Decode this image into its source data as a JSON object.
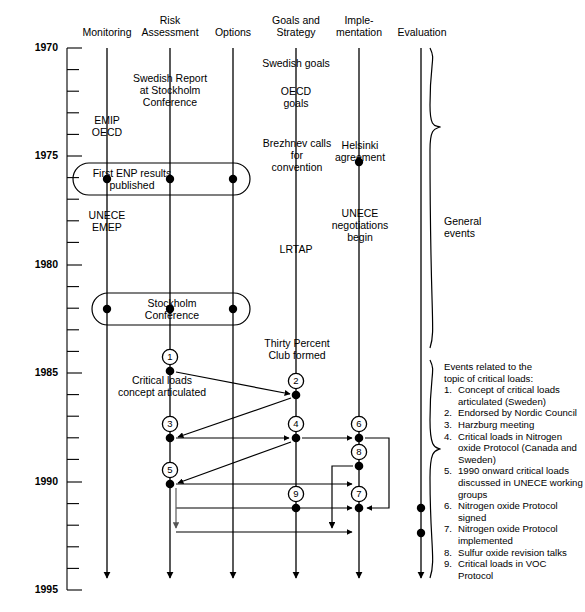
{
  "diagram": {
    "axis": {
      "label": "year",
      "start": 1970,
      "end": 1995,
      "major_ticks": [
        1970,
        1975,
        1980,
        1985,
        1990,
        1995
      ],
      "tick_interval": 1
    },
    "columns": [
      {
        "id": "monitoring",
        "label": "Monitoring"
      },
      {
        "id": "risk",
        "label": "Risk\nAssessment"
      },
      {
        "id": "options",
        "label": "Options"
      },
      {
        "id": "goals",
        "label": "Goals and\nStrategy"
      },
      {
        "id": "implementation",
        "label": "Imple-\nmentation"
      },
      {
        "id": "evaluation",
        "label": "Evaluation"
      }
    ],
    "events": [
      {
        "id": "emip-oecd",
        "column": "monitoring",
        "text": "EMIP\nOECD",
        "year": 1973.6
      },
      {
        "id": "unece-emep",
        "column": "monitoring",
        "text": "UNECE\nEMEP",
        "year": 1976.9
      },
      {
        "id": "swedish-report",
        "column": "risk",
        "text": "Swedish Report\nat Stockholm\nConference",
        "year": 1972.0
      },
      {
        "id": "first-enp",
        "column": "capsule",
        "text": "First ENP results\npublished",
        "year": 1974.2
      },
      {
        "id": "stockholm-conf",
        "column": "capsule",
        "text": "Stockholm\nConference",
        "year": 1981.3
      },
      {
        "id": "swedish-goals",
        "column": "goals",
        "text": "Swedish goals",
        "year": 1970.9
      },
      {
        "id": "oecd-goals",
        "column": "goals",
        "text": "OECD\ngoals",
        "year": 1972.2
      },
      {
        "id": "brezhnev",
        "column": "goals",
        "text": "Brezhnev calls\nfor\nconvention",
        "year": 1974.3
      },
      {
        "id": "lrtap",
        "column": "goals",
        "text": "LRTAP",
        "year": 1978.6
      },
      {
        "id": "helsinki",
        "column": "implementation",
        "text": "Helsinki\nagreement",
        "year": 1974.5
      },
      {
        "id": "unece-negot",
        "column": "implementation",
        "text": "UNECE\nnegotiations\nbegin",
        "year": 1977.4
      },
      {
        "id": "thirty-percent",
        "column": "goals",
        "text": "Thirty Percent\nClub formed",
        "year": 1984.0
      },
      {
        "id": "critical-loads",
        "column": "risk",
        "text": "Critical loads\nconcept articulated",
        "year": 1985.6
      }
    ],
    "numbered_nodes": [
      {
        "n": "1",
        "column": "risk",
        "year": 1984.4
      },
      {
        "n": "2",
        "column": "goals",
        "year": 1985.3
      },
      {
        "n": "3",
        "column": "risk",
        "year": 1987.1
      },
      {
        "n": "4",
        "column": "goals",
        "year": 1987.1
      },
      {
        "n": "5",
        "column": "risk",
        "year": 1989.0
      },
      {
        "n": "6",
        "column": "implementation",
        "year": 1987.1
      },
      {
        "n": "7",
        "column": "implementation",
        "year": 1990.5
      },
      {
        "n": "8",
        "column": "implementation",
        "year": 1988.2
      },
      {
        "n": "9",
        "column": "goals",
        "year": 1990.1
      }
    ],
    "braces": [
      {
        "id": "general-events",
        "label": "General\nevents"
      },
      {
        "id": "critical-loads-events",
        "label": ""
      }
    ],
    "legend": {
      "title": "Events related to the\ntopic of critical loads:",
      "items": [
        {
          "num": "1.",
          "text": "Concept of critical loads articulated (Sweden)"
        },
        {
          "num": "2.",
          "text": "Endorsed by Nordic Council"
        },
        {
          "num": "3.",
          "text": "Harzburg meeting"
        },
        {
          "num": "4.",
          "text": "Critical loads  in Nitrogen oxide Protocol (Canada and Sweden)"
        },
        {
          "num": "5.",
          "text": "1990 onward critical loads discussed in UNECE working groups"
        },
        {
          "num": "6.",
          "text": "Nitrogen oxide Protocol signed"
        },
        {
          "num": "7.",
          "text": "Nitrogen oxide Protocol implemented"
        },
        {
          "num": "8.",
          "text": "Sulfur oxide revision talks"
        },
        {
          "num": "9.",
          "text": "Critical loads in VOC Protocol"
        }
      ]
    },
    "colors": {
      "stroke": "#000000",
      "background": "#ffffff",
      "text": "#000000"
    }
  }
}
